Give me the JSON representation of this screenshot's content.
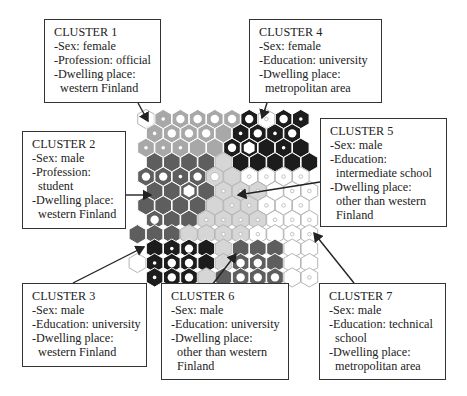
{
  "figure": {
    "type": "self-organizing-map",
    "grid": {
      "cols": 10,
      "rows": 12
    }
  },
  "colors": {
    "dark": "#1c1c1c",
    "mid": "#5e5e5e",
    "light": "#a8a8a8",
    "pale": "#d6d6d6",
    "white": "#ffffff",
    "hex_border_light": "#b5b5b5",
    "line": "#222222"
  },
  "clusters": [
    {
      "id": 1,
      "title": "CLUSTER 1",
      "lines": [
        "-Sex: female",
        "-Profession: official",
        "-Dwelling place:",
        "  western Finland"
      ]
    },
    {
      "id": 2,
      "title": "CLUSTER 2",
      "lines": [
        "-Sex: male",
        "-Profession:",
        "  student",
        "-Dwelling place:",
        "  western Finland"
      ]
    },
    {
      "id": 3,
      "title": "CLUSTER 3",
      "lines": [
        "-Sex: male",
        "-Education: university",
        "-Dwelling place:",
        "  western Finland"
      ]
    },
    {
      "id": 4,
      "title": "CLUSTER 4",
      "lines": [
        "-Sex: female",
        "-Education: university",
        "-Dwelling place:",
        "  metropolitan area"
      ]
    },
    {
      "id": 5,
      "title": "CLUSTER 5",
      "lines": [
        "-Sex: male",
        "-Education:",
        "  intermediate school",
        "-Dwelling place:",
        "  other than western",
        "  Finland"
      ]
    },
    {
      "id": 6,
      "title": "CLUSTER 6",
      "lines": [
        "-Sex: male",
        "-Education: university",
        "-Dwelling place:",
        "  other than western",
        "  Finland"
      ]
    },
    {
      "id": 7,
      "title": "CLUSTER 7",
      "lines": [
        "-Sex: male",
        "-Education: technical",
        "  school",
        "-Dwelling place:",
        "  metropolitan area"
      ]
    }
  ],
  "hex_rows": [
    "wllllldwdd",
    "llllldddd",
    "lllllddddd",
    "mmmmpddddd",
    "mmmmppwwww",
    "mmmmpppwww",
    "mmmmpppwww",
    "mmmppppwww",
    "mmmppppwwww",
    "ddddpmmmww",
    "wddddpmmmww",
    "dddpmmmmww"
  ],
  "hex_dots": [
    "0.1.2.2.2.2.2.1.2.1",
    "1.2.2.2.0.1.2.1.2",
    "1.1.1.0.0.2.3.0.1.0",
    "0.0.0.0.0.0.0.0.0.0",
    "2.2.1.2.2.0.1.1.1.1",
    "0.0.3.0.1.1.1.0.1.1",
    "0.0.0.0.0.1.1.1.1.1",
    "2.0.0.1.1.1.1.1.1.1",
    "0.0.0.0.0.1.1.1.0.1.1",
    "0.1.2.0.0.0.0.0.0.0",
    "0.1.2.2.0.0.2.2.0.0.0",
    "1.2.2.0.0.2.2.2.0.1"
  ]
}
